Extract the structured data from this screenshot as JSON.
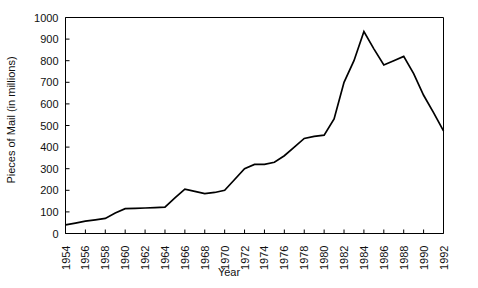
{
  "chart_data": {
    "type": "line",
    "title": "",
    "xlabel": "Year",
    "ylabel": "Pieces of Mail (in millions)",
    "xlim": [
      1954,
      1992
    ],
    "ylim": [
      0,
      1000
    ],
    "grid": false,
    "legend": "none",
    "line_color": "#000000",
    "x": [
      1954,
      1955,
      1956,
      1957,
      1958,
      1959,
      1960,
      1961,
      1962,
      1963,
      1964,
      1965,
      1966,
      1967,
      1968,
      1969,
      1970,
      1971,
      1972,
      1973,
      1974,
      1975,
      1976,
      1977,
      1978,
      1979,
      1980,
      1981,
      1982,
      1983,
      1984,
      1985,
      1986,
      1987,
      1988,
      1989,
      1990,
      1991,
      1992
    ],
    "values": [
      40,
      48,
      57,
      63,
      70,
      95,
      115,
      116,
      118,
      120,
      122,
      165,
      205,
      195,
      185,
      190,
      200,
      250,
      300,
      320,
      320,
      330,
      360,
      400,
      440,
      450,
      455,
      530,
      700,
      800,
      935,
      855,
      780,
      800,
      820,
      740,
      640,
      560,
      475
    ],
    "series": [
      {
        "name": "Pieces of Mail",
        "values": [
          40,
          48,
          57,
          63,
          70,
          95,
          115,
          116,
          118,
          120,
          122,
          165,
          205,
          195,
          185,
          190,
          200,
          250,
          300,
          320,
          320,
          330,
          360,
          400,
          440,
          450,
          455,
          530,
          700,
          800,
          935,
          855,
          780,
          800,
          820,
          740,
          640,
          560,
          475
        ]
      }
    ],
    "ytick_labels": [
      "0",
      "100",
      "200",
      "300",
      "400",
      "500",
      "600",
      "700",
      "800",
      "900",
      "1000"
    ],
    "ytick_values": [
      0,
      100,
      200,
      300,
      400,
      500,
      600,
      700,
      800,
      900,
      1000
    ],
    "xtick_labels": [
      "1954",
      "1956",
      "1958",
      "1960",
      "1962",
      "1964",
      "1966",
      "1968",
      "1970",
      "1972",
      "1974",
      "1976",
      "1978",
      "1980",
      "1982",
      "1984",
      "1986",
      "1988",
      "1990",
      "1992"
    ],
    "xtick_values": [
      1954,
      1956,
      1958,
      1960,
      1962,
      1964,
      1966,
      1968,
      1970,
      1972,
      1974,
      1976,
      1978,
      1980,
      1982,
      1984,
      1986,
      1988,
      1990,
      1992
    ]
  }
}
